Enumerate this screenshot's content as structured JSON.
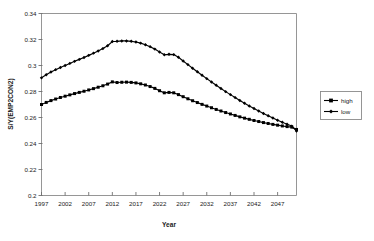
{
  "chart_data": {
    "type": "line",
    "title": "",
    "xlabel": "Year",
    "ylabel": "S/Y(EMP2CON2)",
    "xlim": [
      1997,
      2051
    ],
    "ylim": [
      0.2,
      0.34
    ],
    "ytick_labels": [
      "0.2",
      "0.22",
      "0.24",
      "0.26",
      "0.28",
      "0.3",
      "0.32",
      "0.34"
    ],
    "ytick_values": [
      0.2,
      0.22,
      0.24,
      0.26,
      0.28,
      0.3,
      0.32,
      0.34
    ],
    "xtick_labels": [
      "1997",
      "2002",
      "2007",
      "2012",
      "2017",
      "2022",
      "2027",
      "2032",
      "2037",
      "2042",
      "2047"
    ],
    "xtick_values": [
      1997,
      2002,
      2007,
      2012,
      2017,
      2022,
      2027,
      2032,
      2037,
      2042,
      2047
    ],
    "grid": false,
    "legend_position": "right",
    "x": [
      1997,
      1998,
      1999,
      2000,
      2001,
      2002,
      2003,
      2004,
      2005,
      2006,
      2007,
      2008,
      2009,
      2010,
      2011,
      2012,
      2013,
      2014,
      2015,
      2016,
      2017,
      2018,
      2019,
      2020,
      2021,
      2022,
      2023,
      2024,
      2025,
      2026,
      2027,
      2028,
      2029,
      2030,
      2031,
      2032,
      2033,
      2034,
      2035,
      2036,
      2037,
      2038,
      2039,
      2040,
      2041,
      2042,
      2043,
      2044,
      2045,
      2046,
      2047,
      2048,
      2049,
      2050,
      2051
    ],
    "series": [
      {
        "name": "high",
        "marker": "square",
        "color": "#000000",
        "values": [
          0.27,
          0.2716,
          0.273,
          0.2742,
          0.2754,
          0.2764,
          0.2774,
          0.2784,
          0.2793,
          0.2802,
          0.2812,
          0.2822,
          0.2833,
          0.2844,
          0.2857,
          0.2874,
          0.2869,
          0.2871,
          0.2872,
          0.287,
          0.2866,
          0.2859,
          0.285,
          0.2838,
          0.2824,
          0.2806,
          0.279,
          0.2793,
          0.279,
          0.2776,
          0.276,
          0.2744,
          0.2729,
          0.2715,
          0.2701,
          0.2688,
          0.2675,
          0.2662,
          0.265,
          0.2638,
          0.2627,
          0.2616,
          0.2605,
          0.2595,
          0.2586,
          0.2577,
          0.2569,
          0.2561,
          0.2554,
          0.2547,
          0.2541,
          0.2535,
          0.253,
          0.2526,
          0.2508
        ]
      },
      {
        "name": "low",
        "marker": "diamond",
        "color": "#000000",
        "values": [
          0.2905,
          0.2929,
          0.295,
          0.2968,
          0.2985,
          0.3,
          0.3016,
          0.3032,
          0.3047,
          0.3062,
          0.3078,
          0.3095,
          0.3112,
          0.313,
          0.3152,
          0.3185,
          0.3186,
          0.3189,
          0.3189,
          0.3186,
          0.3181,
          0.3172,
          0.316,
          0.3145,
          0.3126,
          0.3104,
          0.3083,
          0.3086,
          0.3084,
          0.3063,
          0.3035,
          0.3007,
          0.2979,
          0.2952,
          0.2925,
          0.2899,
          0.2873,
          0.2848,
          0.2823,
          0.2799,
          0.2776,
          0.2753,
          0.2731,
          0.271,
          0.2689,
          0.2669,
          0.265,
          0.2631,
          0.2613,
          0.2596,
          0.2579,
          0.2563,
          0.2548,
          0.2534,
          0.2496
        ]
      }
    ]
  },
  "legend": {
    "entries": [
      {
        "label": "high",
        "marker": "square"
      },
      {
        "label": "low",
        "marker": "diamond"
      }
    ]
  }
}
